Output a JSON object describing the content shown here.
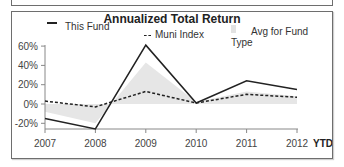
{
  "chart_data": {
    "type": "line",
    "title": "Annualized Total Return",
    "xlabel": "",
    "ylabel": "",
    "categories": [
      "2007",
      "2008",
      "2009",
      "2010",
      "2011",
      "2012"
    ],
    "x_suffix_label": "YTD",
    "yticks": [
      "60%",
      "40%",
      "20%",
      "0%",
      "-20%"
    ],
    "ylim": [
      -30,
      65
    ],
    "grid": false,
    "legend_position": "top",
    "series": [
      {
        "name": "This Fund",
        "style": "solid",
        "color": "#222222",
        "values": [
          -15,
          -26,
          61,
          1,
          24,
          15
        ]
      },
      {
        "name": "Muni Index",
        "style": "dashed",
        "color": "#222222",
        "values": [
          3,
          -3,
          13,
          1,
          10,
          7
        ]
      },
      {
        "name": "Avg for Fund Type",
        "style": "area",
        "color": "#e6e6e6",
        "values": [
          -8,
          -20,
          43,
          2,
          13,
          8
        ]
      }
    ]
  },
  "legend": {
    "this_fund": "This Fund",
    "muni_index": "Muni Index",
    "avg_fund_type": "Avg for Fund Type"
  }
}
